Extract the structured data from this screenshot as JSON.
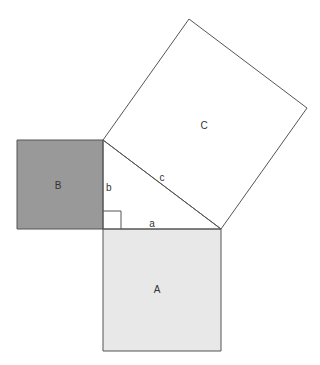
{
  "diagram": {
    "colors": {
      "stroke": "#555555",
      "square_B_fill": "#999999",
      "square_A_fill": "#e8e8e8",
      "square_C_fill": "#ffffff",
      "background": "#ffffff"
    },
    "squares": [
      {
        "id": "A",
        "label": "A",
        "points": "103,229 221,229 221,351 103,351",
        "label_pos": [
          157,
          293
        ]
      },
      {
        "id": "B",
        "label": "B",
        "points": "17,140 103,140 103,229 17,229",
        "label_pos": [
          58,
          189
        ]
      },
      {
        "id": "C",
        "label": "C",
        "points": "103,140 189,19 307,108 221,229",
        "label_pos": [
          204,
          129
        ]
      }
    ],
    "triangle": {
      "points": "103,140 221,229 103,229",
      "sides": [
        {
          "id": "a",
          "label": "a",
          "label_pos": [
            152,
            227
          ]
        },
        {
          "id": "b",
          "label": "b",
          "label_pos": [
            106,
            191
          ]
        },
        {
          "id": "c",
          "label": "c",
          "label_pos": [
            162,
            181
          ]
        }
      ],
      "right_angle_marker": "103,211 121,211 121,229"
    }
  }
}
